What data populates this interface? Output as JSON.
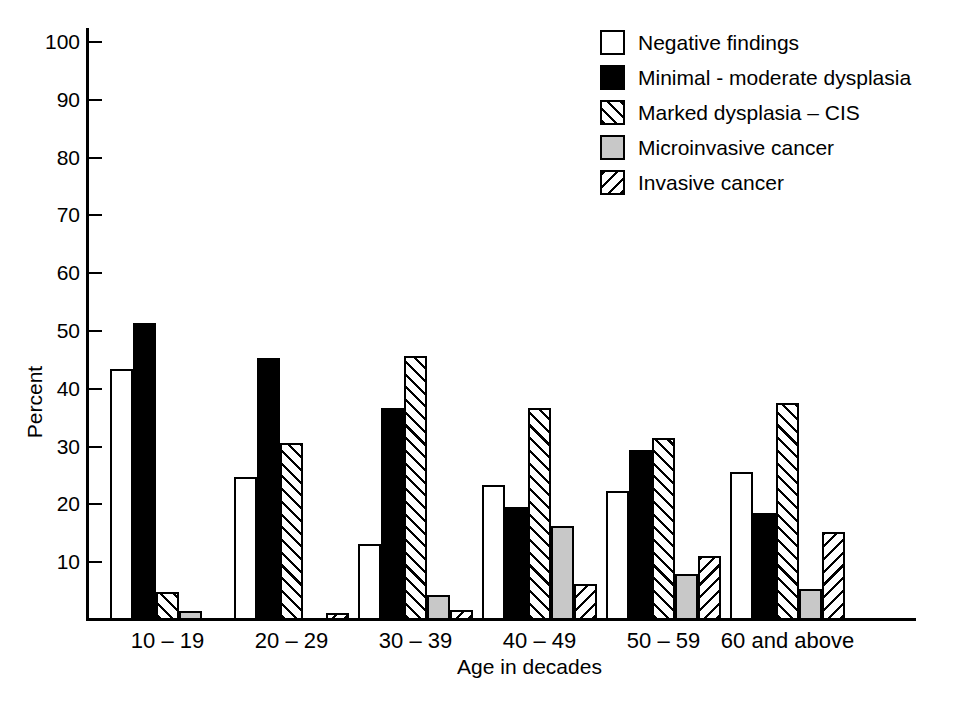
{
  "chart_data": {
    "type": "bar",
    "title": "",
    "xlabel": "Age in decades",
    "ylabel": "Percent",
    "ylim": [
      0,
      100
    ],
    "yticks": [
      10,
      20,
      30,
      40,
      50,
      60,
      70,
      80,
      90,
      100
    ],
    "ytick_labels": [
      "10",
      "20",
      "30",
      "40",
      "50",
      "60",
      "70",
      "80",
      "90",
      "100"
    ],
    "grid": false,
    "legend_position": "top-right",
    "categories": [
      "10 – 19",
      "20 – 29",
      "30 – 39",
      "40 – 49",
      "50 – 59",
      "60 and above"
    ],
    "series": [
      {
        "name": "Negative findings",
        "fill": "white",
        "values": [
          43.4,
          24.7,
          13.1,
          23.3,
          22.3,
          25.6
        ]
      },
      {
        "name": "Minimal - moderate dysplasia",
        "fill": "black",
        "values": [
          51.4,
          45.4,
          36.6,
          19.6,
          29.4,
          18.5
        ]
      },
      {
        "name": "Marked dysplasia – CIS",
        "fill": "hatch-forward",
        "values": [
          4.9,
          30.7,
          45.6,
          36.6,
          31.5,
          37.5
        ]
      },
      {
        "name": "Microinvasive cancer",
        "fill": "gray",
        "values": [
          1.5,
          0.0,
          4.3,
          16.3,
          8.0,
          5.3
        ]
      },
      {
        "name": "Invasive cancer",
        "fill": "hatch-backward",
        "values": [
          0.0,
          1.3,
          1.8,
          6.2,
          11.0,
          15.3
        ]
      }
    ]
  },
  "legend": {
    "items": [
      {
        "label": "Negative findings",
        "fill": "white"
      },
      {
        "label": "Minimal - moderate dysplasia",
        "fill": "black"
      },
      {
        "label": "Marked dysplasia – CIS",
        "fill": "hatch-forward"
      },
      {
        "label": "Microinvasive cancer",
        "fill": "gray"
      },
      {
        "label": "Invasive cancer",
        "fill": "hatch-backward"
      }
    ]
  },
  "axes": {
    "y_title": "Percent",
    "x_title": "Age in decades"
  },
  "caption": {
    "text": ""
  },
  "colors": {
    "ink": "#000000",
    "gray_fill": "#c8c8c8",
    "background": "#ffffff"
  }
}
